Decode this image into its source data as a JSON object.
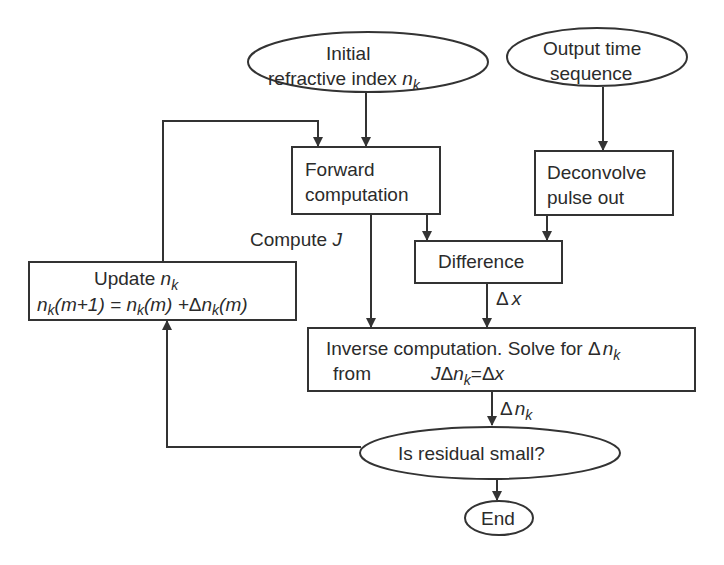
{
  "diagram": {
    "type": "flowchart",
    "nodes": {
      "initial": {
        "line1": "Initial",
        "line2": "refractive index ",
        "var": "n",
        "sub": "k"
      },
      "output": {
        "line1": "Output time",
        "line2": "sequence"
      },
      "forward": {
        "line1": "Forward",
        "line2": "computation"
      },
      "deconvolve": {
        "line1": "Deconvolve",
        "line2": "pulse out"
      },
      "difference": {
        "label": "Difference"
      },
      "update": {
        "line1": "Update ",
        "line1_var": "n",
        "line1_sub": "k",
        "eq": "n_k(m+1) = n_k(m) +Δn_k(m)",
        "eq_parts": {
          "n1": "n",
          "k1": "k",
          "m1": "(m+1) = ",
          "n2": "n",
          "k2": "k",
          "m2": "(m) +",
          "delta": "Δ",
          "n3": "n",
          "k3": "k",
          "m3": "(m)"
        }
      },
      "inverse": {
        "line1": "Inverse computation. Solve for ",
        "line1_delta": "Δ",
        "line1_var": "n",
        "line1_sub": "k",
        "line2_from": "from",
        "line2_J": "J",
        "line2_delta": "Δ",
        "line2_var": "n",
        "line2_sub": "k",
        "line2_eq": "=",
        "line2_delta2": "Δ",
        "line2_x": "x"
      },
      "residual": {
        "label": "Is residual small?"
      },
      "end": {
        "label": "End"
      }
    },
    "edge_labels": {
      "compute_j": "Compute ",
      "compute_j_var": "J",
      "delta_x_delta": "Δ",
      "delta_x_var": "x",
      "delta_nk_delta": "Δ",
      "delta_nk_var": "n",
      "delta_nk_sub": "k"
    },
    "edges": [
      {
        "from": "initial",
        "to": "forward"
      },
      {
        "from": "update",
        "to": "forward"
      },
      {
        "from": "output",
        "to": "deconvolve"
      },
      {
        "from": "forward",
        "to": "difference"
      },
      {
        "from": "deconvolve",
        "to": "difference"
      },
      {
        "from": "forward",
        "to": "inverse",
        "label": "Compute J"
      },
      {
        "from": "difference",
        "to": "inverse",
        "label": "Δx"
      },
      {
        "from": "inverse",
        "to": "residual",
        "label": "Δn_k"
      },
      {
        "from": "residual",
        "to": "update"
      },
      {
        "from": "residual",
        "to": "end"
      }
    ],
    "colors": {
      "stroke": "#333333",
      "text": "#2b2b2b",
      "background": "#ffffff"
    }
  }
}
